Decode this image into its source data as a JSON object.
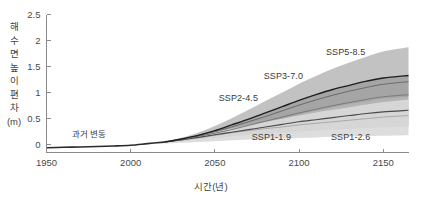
{
  "chart_data": {
    "type": "area",
    "title": "",
    "subtitle": "",
    "xlabel": "시간(년)",
    "ylabel": "해수면 높이 편차 (m)",
    "ylabel_chars": [
      "해",
      "수",
      "면",
      "높",
      "이",
      "편",
      "차",
      "(m)"
    ],
    "xlim": [
      1950,
      2165
    ],
    "ylim": [
      -0.15,
      2.5
    ],
    "xticks": [
      1950,
      2000,
      2050,
      2100,
      2150
    ],
    "xtick_labels": [
      "1950",
      "2000",
      "2050",
      "2100",
      "2150"
    ],
    "yticks": [
      0,
      0.5,
      1,
      1.5,
      2,
      2.5
    ],
    "ytick_labels": [
      "0",
      "0.5",
      "1",
      "1.5",
      "2",
      "2.5"
    ],
    "grid": false,
    "legend_position": "inline-annotations",
    "x": [
      1950,
      1970,
      1990,
      2000,
      2010,
      2020,
      2030,
      2040,
      2050,
      2060,
      2070,
      2080,
      2090,
      2100,
      2110,
      2120,
      2130,
      2140,
      2150,
      2165
    ],
    "historical": {
      "name": "과거 변동",
      "label": "과거 변동",
      "color": "#2b2b2b",
      "x": [
        1950,
        1960,
        1970,
        1980,
        1990,
        2000,
        2010,
        2020
      ],
      "values": [
        -0.06,
        -0.05,
        -0.045,
        -0.035,
        -0.025,
        -0.01,
        0.02,
        0.05
      ]
    },
    "series": [
      {
        "name": "SSP1-1.9",
        "label": "SSP1-1.9",
        "color": "#a9a9a9",
        "label_color": "#a0a0a0",
        "values": [
          null,
          null,
          null,
          null,
          null,
          0.05,
          0.09,
          0.13,
          0.18,
          0.23,
          0.27,
          0.31,
          0.34,
          0.38,
          0.41,
          0.44,
          0.47,
          0.5,
          0.53,
          0.56
        ],
        "band_low": [
          null,
          null,
          null,
          null,
          null,
          0.04,
          0.07,
          0.1,
          0.13,
          0.16,
          0.19,
          0.21,
          0.23,
          0.25,
          0.27,
          0.29,
          0.3,
          0.32,
          0.33,
          0.35
        ],
        "band_high": [
          null,
          null,
          null,
          null,
          null,
          0.06,
          0.11,
          0.17,
          0.24,
          0.31,
          0.38,
          0.44,
          0.5,
          0.56,
          0.62,
          0.67,
          0.72,
          0.77,
          0.82,
          0.87
        ]
      },
      {
        "name": "SSP1-2.6",
        "label": "SSP1-2.6",
        "color": "#4a4a4a",
        "label_color": "#3a3a3a",
        "values": [
          null,
          null,
          null,
          null,
          null,
          0.05,
          0.09,
          0.14,
          0.19,
          0.24,
          0.29,
          0.34,
          0.39,
          0.44,
          0.48,
          0.52,
          0.56,
          0.6,
          0.63,
          0.66
        ]
      },
      {
        "name": "SSP2-4.5",
        "label": "SSP2-4.5",
        "color": "#7a7a7a",
        "label_color": "#7d7d7d",
        "values": [
          null,
          null,
          null,
          null,
          null,
          0.05,
          0.1,
          0.16,
          0.22,
          0.29,
          0.37,
          0.45,
          0.53,
          0.61,
          0.68,
          0.75,
          0.81,
          0.87,
          0.92,
          0.96
        ]
      },
      {
        "name": "SSP3-7.0",
        "label": "SSP3-7.0",
        "color": "#6a6a6a",
        "label_color": "#7d7d7d",
        "values": [
          null,
          null,
          null,
          null,
          null,
          0.05,
          0.1,
          0.17,
          0.25,
          0.34,
          0.44,
          0.54,
          0.65,
          0.76,
          0.86,
          0.95,
          1.03,
          1.1,
          1.16,
          1.21
        ]
      },
      {
        "name": "SSP5-8.5",
        "label": "SSP5-8.5",
        "color": "#1f1f1f",
        "label_color": "#2b2b2b",
        "values": [
          null,
          null,
          null,
          null,
          null,
          0.05,
          0.11,
          0.18,
          0.27,
          0.38,
          0.49,
          0.61,
          0.73,
          0.85,
          0.96,
          1.06,
          1.14,
          1.22,
          1.28,
          1.33
        ],
        "band_low": [
          null,
          null,
          null,
          null,
          null,
          0.04,
          0.08,
          0.13,
          0.19,
          0.26,
          0.34,
          0.42,
          0.5,
          0.58,
          0.65,
          0.72,
          0.78,
          0.83,
          0.88,
          0.92
        ],
        "band_high": [
          null,
          null,
          null,
          null,
          null,
          0.06,
          0.13,
          0.23,
          0.36,
          0.51,
          0.67,
          0.84,
          1.0,
          1.17,
          1.32,
          1.46,
          1.58,
          1.69,
          1.79,
          1.87
        ]
      }
    ],
    "band_colors": {
      "outer_upper": "#b5b5b5",
      "inner_mid": "#9a9a9a",
      "lower_light": "#d8d8d8"
    }
  },
  "axis": {
    "x_title": "시간(년)",
    "y_title": "해수면 높이 편차 (m)"
  }
}
